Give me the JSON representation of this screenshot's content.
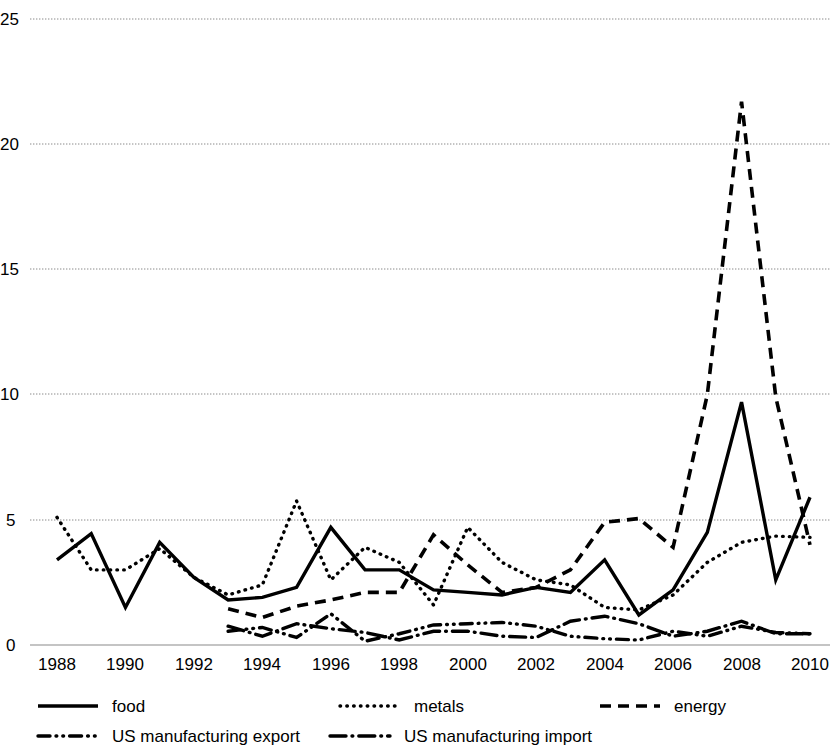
{
  "chart_data": {
    "type": "line",
    "title": "",
    "xlabel": "",
    "ylabel": "",
    "xlim": [
      1988,
      2010
    ],
    "ylim": [
      0,
      25
    ],
    "grid": true,
    "legend_position": "bottom",
    "x": [
      1988,
      1989,
      1990,
      1991,
      1992,
      1993,
      1994,
      1995,
      1996,
      1997,
      1998,
      1999,
      2000,
      2001,
      2002,
      2003,
      2004,
      2005,
      2006,
      2007,
      2008,
      2009,
      2010
    ],
    "xtick_labels": [
      "1988",
      "1990",
      "1992",
      "1994",
      "1996",
      "1998",
      "2000",
      "2002",
      "2004",
      "2006",
      "2008",
      "2010"
    ],
    "xticks": [
      1988,
      1990,
      1992,
      1994,
      1996,
      1998,
      2000,
      2002,
      2004,
      2006,
      2008,
      2010
    ],
    "ytick_labels": [
      "0",
      "5",
      "10",
      "15",
      "20",
      "25"
    ],
    "yticks": [
      0,
      5,
      10,
      15,
      20,
      25
    ],
    "series": [
      {
        "name": "food",
        "style": "solid",
        "values": [
          3.4,
          4.45,
          1.5,
          4.1,
          2.7,
          1.8,
          1.9,
          2.3,
          4.7,
          3.0,
          3.0,
          2.2,
          2.1,
          2.0,
          2.3,
          2.1,
          3.4,
          1.2,
          2.2,
          4.5,
          9.7,
          2.6,
          5.9
        ]
      },
      {
        "name": "metals",
        "style": "dotted",
        "values": [
          5.1,
          3.0,
          3.0,
          3.85,
          2.7,
          2.0,
          2.4,
          5.75,
          2.6,
          3.9,
          3.3,
          1.6,
          4.7,
          3.3,
          2.6,
          2.4,
          1.5,
          1.4,
          2.0,
          3.3,
          4.1,
          4.35,
          4.3
        ]
      },
      {
        "name": "energy",
        "style": "dashed",
        "values": [
          null,
          null,
          null,
          null,
          null,
          1.45,
          1.1,
          1.55,
          1.8,
          2.1,
          2.1,
          4.4,
          3.2,
          2.1,
          2.3,
          3.0,
          4.9,
          5.05,
          3.9,
          10.0,
          21.7,
          9.9,
          4.0
        ]
      },
      {
        "name": "US manufacturing export",
        "style": "dash-dot-dot",
        "values": [
          null,
          null,
          null,
          null,
          null,
          0.55,
          0.7,
          0.3,
          1.25,
          0.15,
          0.45,
          0.8,
          0.85,
          0.9,
          0.75,
          0.35,
          0.25,
          0.2,
          0.55,
          0.35,
          0.75,
          0.5,
          0.45
        ]
      },
      {
        "name": "US manufacturing import",
        "style": "dash-dot",
        "values": [
          null,
          null,
          null,
          null,
          null,
          0.75,
          0.35,
          0.85,
          0.65,
          0.5,
          0.2,
          0.55,
          0.55,
          0.35,
          0.3,
          0.95,
          1.15,
          0.85,
          0.35,
          0.55,
          0.95,
          0.45,
          0.45
        ]
      }
    ]
  },
  "legend": {
    "items": [
      {
        "label": "food",
        "key": "solid"
      },
      {
        "label": "metals",
        "key": "dotted"
      },
      {
        "label": "energy",
        "key": "dashed"
      },
      {
        "label": "US manufacturing export",
        "key": "dash-dot-dot"
      },
      {
        "label": "US manufacturing import",
        "key": "dash-dot"
      }
    ]
  },
  "colors": {
    "series": "#000000",
    "grid": "#8a8a8a",
    "background": "#ffffff"
  }
}
